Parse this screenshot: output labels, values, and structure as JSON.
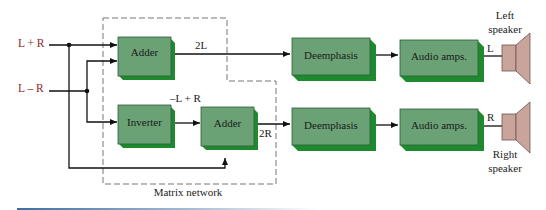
{
  "diagram": {
    "inputs": [
      {
        "id": "lpr",
        "label": "L + R"
      },
      {
        "id": "lmr",
        "label": "L – R"
      }
    ],
    "matrix_network": {
      "label": "Matrix network"
    },
    "blocks": [
      {
        "id": "adder1",
        "label": "Adder"
      },
      {
        "id": "inverter",
        "label": "Inverter"
      },
      {
        "id": "adder2",
        "label": "Adder"
      },
      {
        "id": "deemph1",
        "label": "Deemphasis"
      },
      {
        "id": "deemph2",
        "label": "Deemphasis"
      },
      {
        "id": "amp1",
        "label": "Audio amps."
      },
      {
        "id": "amp2",
        "label": "Audio amps."
      }
    ],
    "signals": {
      "two_l": "2L",
      "two_r": "2R",
      "neg_l_plus_r": "–L + R",
      "l_out": "L",
      "r_out": "R"
    },
    "speakers": {
      "left": {
        "line1": "Left",
        "line2": "speaker"
      },
      "right": {
        "line1": "Right",
        "line2": "speaker"
      }
    },
    "colors": {
      "block_face": "#6aa276",
      "block_side": "#1e8a2e",
      "input_label": "#8b2a2a",
      "speaker": "#c8a49a"
    }
  }
}
